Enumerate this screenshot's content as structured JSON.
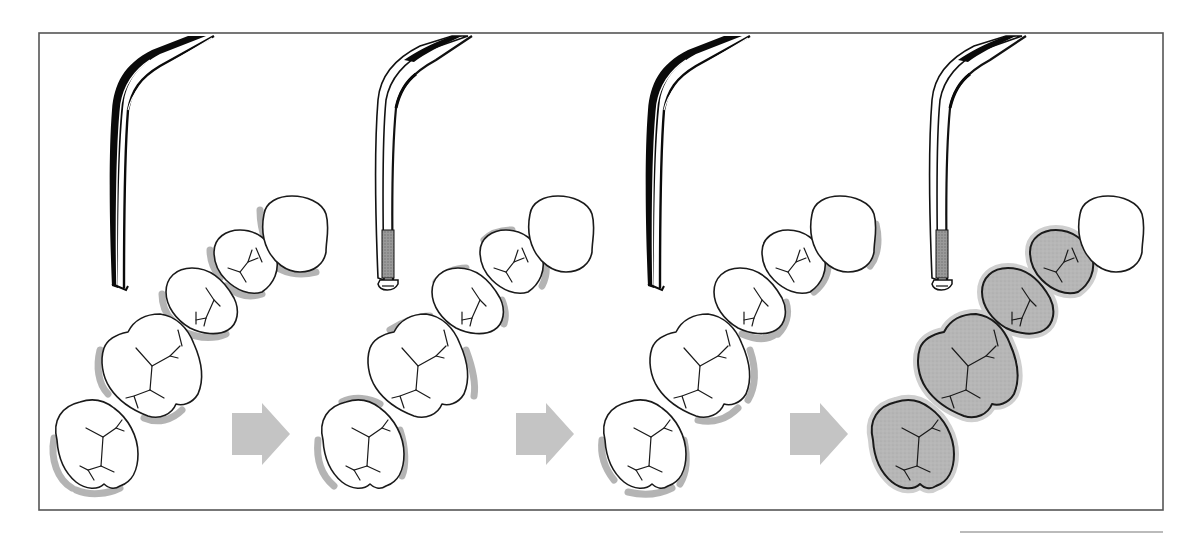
{
  "figure": {
    "panel_count": 4,
    "colors": {
      "frame": "#555555",
      "tooth_fill_clean": "#ffffff",
      "tooth_fill_treated": "#b4b4b4",
      "tooth_outline": "#1a1a1a",
      "shadow": "#a8a8a8",
      "arrow": "#c4c4c4",
      "instrument_dark": "#0a0a0a",
      "instrument_tip_hatch": "#8a8a8a"
    }
  },
  "panels": [
    {
      "id": 1,
      "instrument": "curette-dark-shank",
      "instrument_tip": "plain",
      "teeth_state": "untreated",
      "shadow_side": "lower-left"
    },
    {
      "id": 2,
      "instrument": "curette-light-shank",
      "instrument_tip": "hatched",
      "teeth_state": "untreated",
      "shadow_side": "upper-and-right"
    },
    {
      "id": 3,
      "instrument": "curette-dark-shank",
      "instrument_tip": "plain",
      "teeth_state": "untreated",
      "shadow_side": "right"
    },
    {
      "id": 4,
      "instrument": "curette-light-shank",
      "instrument_tip": "hatched",
      "teeth_state": "treated-shaded",
      "shadow_side": "all-around"
    }
  ],
  "arrows": [
    {
      "from": 1,
      "to": 2,
      "direction": "right"
    },
    {
      "from": 2,
      "to": 3,
      "direction": "right"
    },
    {
      "from": 3,
      "to": 4,
      "direction": "right"
    }
  ]
}
